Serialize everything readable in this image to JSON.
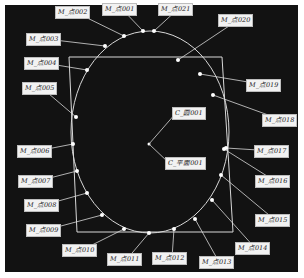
{
  "viewport": {
    "background": "#121212",
    "line_color": "#d8d8d8",
    "point_color": "#ffffff"
  },
  "geometry": {
    "circle": {
      "cx": 150,
      "cy": 132,
      "rx": 79,
      "ry": 101
    },
    "plane_rect": [
      [
        69,
        57
      ],
      [
        222,
        57
      ],
      [
        233,
        232
      ],
      [
        77,
        232
      ]
    ],
    "center_marker": [
      149,
      144
    ]
  },
  "center_labels": [
    {
      "id": "circle",
      "text": "C_圆001",
      "x": 172,
      "y": 107,
      "anchor": [
        149,
        144
      ]
    },
    {
      "id": "plane",
      "text": "C_平面001",
      "x": 165,
      "y": 157,
      "anchor": [
        149,
        144
      ]
    }
  ],
  "points": [
    {
      "text": "M_点001",
      "px": 143,
      "py": 31,
      "lx": 102,
      "ly": 3
    },
    {
      "text": "M_点002",
      "px": 124,
      "py": 36,
      "lx": 55,
      "ly": 6
    },
    {
      "text": "M_点003",
      "px": 105,
      "py": 46,
      "lx": 26,
      "ly": 33
    },
    {
      "text": "M_点004",
      "px": 87,
      "py": 70,
      "lx": 24,
      "ly": 57
    },
    {
      "text": "M_点005",
      "px": 76,
      "py": 117,
      "lx": 22,
      "ly": 82
    },
    {
      "text": "M_点006",
      "px": 73,
      "py": 144,
      "lx": 17,
      "ly": 145
    },
    {
      "text": "M_点007",
      "px": 77,
      "py": 171,
      "lx": 18,
      "ly": 175
    },
    {
      "text": "M_点008",
      "px": 87,
      "py": 193,
      "lx": 24,
      "ly": 199
    },
    {
      "text": "M_点009",
      "px": 102,
      "py": 215,
      "lx": 26,
      "ly": 224
    },
    {
      "text": "M_点010",
      "px": 124,
      "py": 229,
      "lx": 62,
      "ly": 244
    },
    {
      "text": "M_点011",
      "px": 149,
      "py": 233,
      "lx": 107,
      "ly": 253
    },
    {
      "text": "M_点012",
      "px": 174,
      "py": 229,
      "lx": 152,
      "ly": 252
    },
    {
      "text": "M_点013",
      "px": 195,
      "py": 219,
      "lx": 199,
      "ly": 256
    },
    {
      "text": "M_点014",
      "px": 212,
      "py": 200,
      "lx": 235,
      "ly": 242
    },
    {
      "text": "M_点015",
      "px": 221,
      "py": 175,
      "lx": 255,
      "ly": 214
    },
    {
      "text": "M_点016",
      "px": 224,
      "py": 149,
      "lx": 255,
      "ly": 175
    },
    {
      "text": "M_点017",
      "px": 226,
      "py": 148,
      "lx": 254,
      "ly": 145
    },
    {
      "text": "M_点018",
      "px": 213,
      "py": 95,
      "lx": 262,
      "ly": 114
    },
    {
      "text": "M_点019",
      "px": 200,
      "py": 74,
      "lx": 246,
      "ly": 79
    },
    {
      "text": "M_点020",
      "px": 178,
      "py": 60,
      "lx": 218,
      "ly": 14
    },
    {
      "text": "M_点021",
      "px": 154,
      "py": 31,
      "lx": 158,
      "ly": 3
    }
  ]
}
